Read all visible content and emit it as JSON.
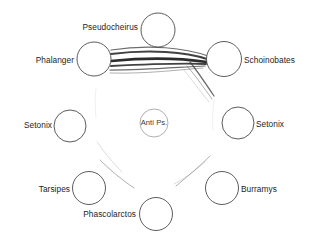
{
  "figure": {
    "type": "network-diagram",
    "background_color": "#ffffff",
    "node_stroke_color": "#4a4a4a",
    "edge_color": "#2c2c2c",
    "label_color": "#1d1d1d"
  },
  "nodes": [
    {
      "id": "pseudocheirus",
      "label": "Pseudocheirus",
      "cx": 158,
      "cy": 30,
      "r": 17,
      "label_side": "left",
      "label_x": 138,
      "label_y": 28,
      "faint": false
    },
    {
      "id": "phalanger",
      "label": "Phalanger",
      "cx": 94,
      "cy": 59,
      "r": 17,
      "label_side": "left",
      "label_x": 74,
      "label_y": 61,
      "faint": false
    },
    {
      "id": "schoinobates",
      "label": "Schoinobates",
      "cx": 224,
      "cy": 59,
      "r": 17.5,
      "label_side": "right",
      "label_x": 244,
      "label_y": 61,
      "faint": false
    },
    {
      "id": "setonix-left",
      "label": "Setonix",
      "cx": 70,
      "cy": 126,
      "r": 16,
      "label_side": "left",
      "label_x": 52,
      "label_y": 126,
      "faint": false
    },
    {
      "id": "anti-ps",
      "label": "Anti Ps.",
      "cx": 154,
      "cy": 123,
      "r": 14,
      "label_side": "center",
      "label_x": 154,
      "label_y": 123,
      "faint": true
    },
    {
      "id": "setonix-right",
      "label": "Setonix",
      "cx": 238,
      "cy": 123,
      "r": 16,
      "label_side": "right",
      "label_x": 256,
      "label_y": 125,
      "faint": false
    },
    {
      "id": "tarsipes",
      "label": "Tarsipes",
      "cx": 89,
      "cy": 188,
      "r": 16.5,
      "label_side": "left",
      "label_x": 70,
      "label_y": 190,
      "faint": false
    },
    {
      "id": "burramys",
      "label": "Burramys",
      "cx": 222,
      "cy": 188,
      "r": 16.5,
      "label_side": "right",
      "label_x": 241,
      "label_y": 190,
      "faint": false
    },
    {
      "id": "phascolarctos",
      "label": "Phascolarctos",
      "cx": 156,
      "cy": 214,
      "r": 16.5,
      "label_side": "left",
      "label_x": 136,
      "label_y": 215,
      "faint": false
    }
  ],
  "edges": [
    {
      "id": "phalanger-schoinobates-1",
      "from": "phalanger",
      "to": "schoinobates",
      "weight": "medium",
      "path": "M 111 50 C 150 44, 185 48, 208 56"
    },
    {
      "id": "phalanger-schoinobates-2",
      "from": "phalanger",
      "to": "schoinobates",
      "weight": "heavy",
      "path": "M 111 54 C 150 49, 186 52, 207 59"
    },
    {
      "id": "phalanger-schoinobates-3",
      "from": "phalanger",
      "to": "schoinobates",
      "weight": "very-heavy",
      "path": "M 111 61 C 152 57, 186 59, 207 62"
    },
    {
      "id": "phalanger-schoinobates-4",
      "from": "phalanger",
      "to": "schoinobates",
      "weight": "heavy",
      "path": "M 111 66 C 151 64, 184 63, 206 64"
    },
    {
      "id": "phalanger-schoinobates-5",
      "from": "phalanger",
      "to": "schoinobates",
      "weight": "medium",
      "path": "M 110 70 C 148 70, 180 67, 205 66"
    },
    {
      "id": "phalanger-schoinobates-6",
      "from": "phalanger",
      "to": "schoinobates",
      "weight": "light",
      "path": "M 110 73 C 146 74, 176 70, 203 68"
    },
    {
      "id": "schoinobates-down-1",
      "from": "schoinobates",
      "to": "setonix-right",
      "weight": "medium",
      "path": "M 190 62 C 198 72, 206 84, 214 96"
    },
    {
      "id": "schoinobates-down-2",
      "from": "schoinobates",
      "to": "setonix-right",
      "weight": "light",
      "path": "M 187 66 C 196 76, 204 88, 212 99"
    },
    {
      "id": "schoinobates-down-3",
      "from": "schoinobates",
      "to": "setonix-right",
      "weight": "faint",
      "path": "M 184 70 C 192 80, 200 91, 209 102"
    },
    {
      "id": "phalanger-setonix-left",
      "from": "phalanger",
      "to": "setonix-left",
      "weight": "ghost",
      "path": "M 96 88 C 95 98, 95 108, 96 118"
    },
    {
      "id": "setonix-left-tarsipes",
      "from": "setonix-left",
      "to": "tarsipes",
      "weight": "faint",
      "path": "M 97 142 C 104 152, 112 162, 122 172"
    },
    {
      "id": "tarsipes-phascolarctos",
      "from": "tarsipes",
      "to": "phascolarctos",
      "weight": "light",
      "path": "M 100 160 C 110 170, 122 180, 134 188"
    },
    {
      "id": "setonix-right-down",
      "from": "setonix-right",
      "to": "burramys",
      "weight": "ghost",
      "path": "M 214 100 C 213 110, 212 120, 213 130"
    },
    {
      "id": "burramys-phascolarctos",
      "from": "burramys",
      "to": "phascolarctos",
      "weight": "light",
      "path": "M 210 156 C 200 166, 188 176, 176 186"
    },
    {
      "id": "phascolarctos-right",
      "from": "phascolarctos",
      "to": "burramys",
      "weight": "faint",
      "path": "M 205 162 C 196 170, 186 178, 174 184"
    }
  ]
}
